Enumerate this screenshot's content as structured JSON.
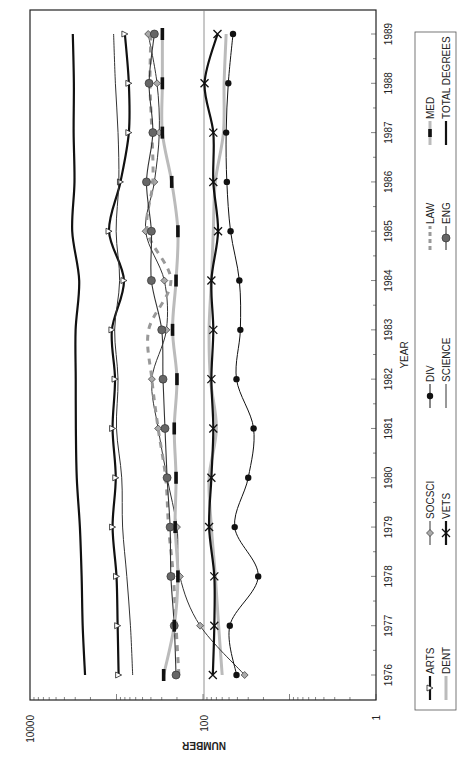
{
  "chart_data": {
    "type": "line",
    "orientation": "rotated-90-clockwise",
    "title": "",
    "xlabel": "YEAR",
    "ylabel": "NUMBER",
    "yscale": "log",
    "ylim": [
      1,
      10000
    ],
    "y_ticks": [
      "10000",
      "100",
      "1"
    ],
    "x": [
      1976,
      1977,
      1978,
      1979,
      1980,
      1981,
      1982,
      1983,
      1984,
      1985,
      1986,
      1987,
      1988,
      1989
    ],
    "x_ticks": [
      "1976",
      "1977",
      "1978",
      "1979",
      "1980",
      "1981",
      "1982",
      "1983",
      "1984",
      "1985",
      "1986",
      "1987",
      "1988",
      "1989"
    ],
    "reference_line": 100,
    "grid": false,
    "legend_position": "right",
    "series": [
      {
        "name": "ARTS",
        "key": "arts",
        "color": "#111111",
        "style": "solid-thick",
        "marker": "triangle",
        "values": [
          945,
          970,
          1000,
          1110,
          1020,
          1110,
          1040,
          1130,
          820,
          1220,
          900,
          720,
          720,
          800
        ]
      },
      {
        "name": "DENT",
        "key": "dent",
        "color": "#bbbbbb",
        "style": "solid-thick",
        "marker": "none",
        "values": [
          60,
          66,
          72,
          80,
          85,
          70,
          82,
          85,
          80,
          76,
          72,
          58,
          57,
          54
        ]
      },
      {
        "name": "SOCSCI",
        "key": "socsci",
        "color": "#333333",
        "style": "solid-thin",
        "marker": "diamond",
        "values": [
          33,
          108,
          185,
          200,
          260,
          330,
          390,
          265,
          280,
          460,
          365,
          320,
          340,
          430
        ]
      },
      {
        "name": "VETS",
        "key": "vets",
        "color": "#111111",
        "style": "solid-thick",
        "marker": "x",
        "values": [
          77,
          74,
          74,
          85,
          80,
          76,
          80,
          76,
          80,
          67,
          76,
          76,
          96,
          68
        ]
      },
      {
        "name": "DIV",
        "key": "div",
        "color": "#111111",
        "style": "solid-thin",
        "marker": "circle-black",
        "values": [
          41,
          49,
          23,
          43,
          30,
          26,
          41,
          37,
          38,
          48,
          53,
          54,
          51,
          45
        ]
      },
      {
        "name": "SCIENCE",
        "key": "science",
        "color": "#333333",
        "style": "solid-thin",
        "marker": "none",
        "values": [
          650,
          690,
          760,
          850,
          870,
          1000,
          960,
          1050,
          920,
          1010,
          940,
          960,
          1030,
          1080
        ]
      },
      {
        "name": "LAW",
        "key": "law",
        "color": "#999999",
        "style": "dashed",
        "marker": "none",
        "values": [
          190,
          205,
          220,
          250,
          270,
          330,
          390,
          425,
          235,
          440,
          380,
          390,
          410,
          400
        ]
      },
      {
        "name": "ENG",
        "key": "eng",
        "color": "#666666",
        "style": "solid-thin-gray",
        "marker": "circle-gray",
        "values": [
          205,
          215,
          235,
          240,
          260,
          275,
          290,
          300,
          395,
          395,
          450,
          380,
          420,
          365
        ]
      },
      {
        "name": "MED",
        "key": "med",
        "color": "#bbbbbb",
        "style": "gray-with-black-dashes",
        "marker": "none",
        "values": [
          285,
          215,
          195,
          210,
          205,
          215,
          200,
          225,
          205,
          195,
          230,
          295,
          295,
          295
        ]
      },
      {
        "name": "TOTAL DEGREES",
        "key": "total",
        "color": "#111111",
        "style": "solid-thick",
        "marker": "none",
        "values": [
          2310,
          2460,
          2530,
          2650,
          2880,
          2950,
          2960,
          2970,
          2700,
          3250,
          3060,
          3130,
          3110,
          3200
        ]
      }
    ]
  }
}
